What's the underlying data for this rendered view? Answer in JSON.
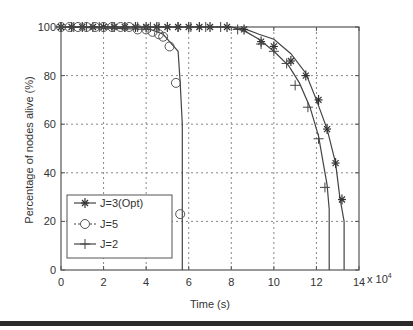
{
  "chart_data": {
    "type": "line",
    "title": "",
    "xlabel": "Time (s)",
    "ylabel": "Percentage of nodes alive (%)",
    "x_multiplier_label": "x 10",
    "x_multiplier_exp": "4",
    "xlim": [
      0,
      14
    ],
    "ylim": [
      0,
      100
    ],
    "xticks": [
      0,
      2,
      4,
      6,
      8,
      10,
      12,
      14
    ],
    "yticks": [
      0,
      20,
      40,
      60,
      80,
      100
    ],
    "grid": true,
    "legend_position": "lower left",
    "series": [
      {
        "name": "J=3(Opt)",
        "marker": "asterisk",
        "line": [
          [
            0,
            100
          ],
          [
            7,
            100
          ],
          [
            8,
            100
          ],
          [
            8.7,
            99
          ],
          [
            9.3,
            97
          ],
          [
            10,
            95
          ],
          [
            10.8,
            89
          ],
          [
            11.5,
            81
          ],
          [
            12,
            70
          ],
          [
            12.5,
            58
          ],
          [
            12.9,
            44
          ],
          [
            13.1,
            30
          ],
          [
            13.3,
            20
          ],
          [
            13.3,
            0
          ]
        ],
        "markers": [
          [
            0,
            100
          ],
          [
            0.5,
            100
          ],
          [
            1,
            100
          ],
          [
            1.5,
            100
          ],
          [
            2,
            100
          ],
          [
            2.5,
            100
          ],
          [
            3,
            100
          ],
          [
            3.5,
            100
          ],
          [
            4,
            100
          ],
          [
            4.5,
            100
          ],
          [
            5,
            100
          ],
          [
            5.5,
            100
          ],
          [
            6,
            100
          ],
          [
            6.5,
            100
          ],
          [
            7,
            100
          ],
          [
            7.8,
            100
          ],
          [
            8.6,
            99
          ],
          [
            9.4,
            94
          ],
          [
            10.0,
            92
          ],
          [
            10.8,
            86
          ],
          [
            11.5,
            80
          ],
          [
            12.1,
            70
          ],
          [
            12.5,
            58
          ],
          [
            12.9,
            44
          ],
          [
            13.2,
            29
          ]
        ]
      },
      {
        "name": "J=5",
        "marker": "circle",
        "line": [
          [
            0,
            100
          ],
          [
            4.2,
            99
          ],
          [
            4.8,
            97
          ],
          [
            5.1,
            94
          ],
          [
            5.5,
            90
          ],
          [
            5.6,
            77
          ],
          [
            5.7,
            60
          ],
          [
            5.7,
            25
          ],
          [
            5.7,
            0
          ]
        ],
        "markers": [
          [
            0,
            100
          ],
          [
            0.4,
            100
          ],
          [
            0.8,
            100
          ],
          [
            1.2,
            100
          ],
          [
            1.6,
            100
          ],
          [
            2,
            100
          ],
          [
            2.4,
            100
          ],
          [
            2.8,
            100
          ],
          [
            3.2,
            100
          ],
          [
            3.6,
            99
          ],
          [
            4.0,
            99
          ],
          [
            4.3,
            98
          ],
          [
            4.6,
            97
          ],
          [
            4.8,
            96
          ],
          [
            5.1,
            92
          ],
          [
            5.4,
            77
          ],
          [
            5.6,
            23
          ]
        ]
      },
      {
        "name": "J=2",
        "marker": "plus",
        "line": [
          [
            0,
            100
          ],
          [
            7,
            100
          ],
          [
            8,
            100
          ],
          [
            8.7,
            98
          ],
          [
            9.3,
            95
          ],
          [
            10,
            90
          ],
          [
            10.7,
            84
          ],
          [
            11.2,
            77
          ],
          [
            11.7,
            67
          ],
          [
            12.1,
            55
          ],
          [
            12.3,
            45
          ],
          [
            12.5,
            35
          ],
          [
            12.6,
            25
          ],
          [
            12.6,
            0
          ]
        ],
        "markers": [
          [
            0,
            100
          ],
          [
            0.6,
            100
          ],
          [
            1.2,
            100
          ],
          [
            1.8,
            100
          ],
          [
            2.4,
            100
          ],
          [
            3,
            100
          ],
          [
            3.6,
            100
          ],
          [
            4.2,
            100
          ],
          [
            4.6,
            100
          ],
          [
            5,
            100
          ],
          [
            5.5,
            100
          ],
          [
            6.1,
            100
          ],
          [
            6.8,
            100
          ],
          [
            7.5,
            100
          ],
          [
            8.3,
            99
          ],
          [
            9.4,
            93
          ],
          [
            10.0,
            90
          ],
          [
            10.6,
            85
          ],
          [
            11.0,
            76
          ],
          [
            11.6,
            67
          ],
          [
            12.1,
            54
          ],
          [
            12.4,
            34
          ]
        ]
      }
    ]
  }
}
